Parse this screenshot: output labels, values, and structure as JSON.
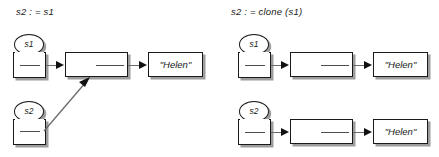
{
  "diagram": {
    "title_left": "s2 : = s1",
    "title_right": "s2 : = clone (s1)",
    "colors": {
      "background": "#ffffff",
      "stroke": "#1a1a1a",
      "shadow": "#8c8c8c",
      "arrow": "#6b6b6b",
      "arrow_head": "#111111",
      "text": "#1a1a1a"
    },
    "left_panel": {
      "name": "reference-assignment",
      "title": "s2 : = s1",
      "variables": [
        {
          "label": "s1",
          "name": "variable-s1"
        },
        {
          "label": "s2",
          "name": "variable-s2"
        }
      ],
      "object_box_label": "",
      "value_label": "\"Helen\"",
      "shared_object": true,
      "description_order": [
        "s1",
        "s2"
      ]
    },
    "right_panel": {
      "name": "clone-assignment",
      "title": "s2 : = clone (s1)",
      "rows": [
        {
          "variable": "s1",
          "name": "clone-row-s1",
          "object_box_label": "",
          "value_label": "\"Helen\""
        },
        {
          "variable": "s2",
          "name": "clone-row-s2",
          "object_box_label": "",
          "value_label": "\"Helen\""
        }
      ],
      "shared_object": false
    }
  }
}
